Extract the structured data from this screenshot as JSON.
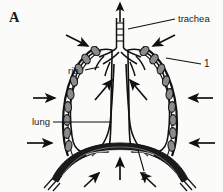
{
  "figure": {
    "panel_letter": "A",
    "background_color": "#fbfbfa",
    "ink_color": "#111111",
    "labels": {
      "trachea": "trachea",
      "rib": "rib",
      "lung": "lung",
      "callout_one": "1",
      "callout_two": "2"
    },
    "structures": [
      {
        "name": "trachea",
        "kind": "airway"
      },
      {
        "name": "bronchi",
        "kind": "airway"
      },
      {
        "name": "left-lung",
        "kind": "organ"
      },
      {
        "name": "right-lung",
        "kind": "organ"
      },
      {
        "name": "rib-cage-left",
        "kind": "skeletal"
      },
      {
        "name": "rib-cage-right",
        "kind": "skeletal"
      },
      {
        "name": "diaphragm",
        "kind": "muscle"
      },
      {
        "name": "mediastinum",
        "kind": "organ"
      }
    ],
    "arrows": {
      "airflow_up_count": 1,
      "rib_expansion_count": 6,
      "intra_thoracic_count": 2,
      "diaphragm_count": 3
    }
  }
}
